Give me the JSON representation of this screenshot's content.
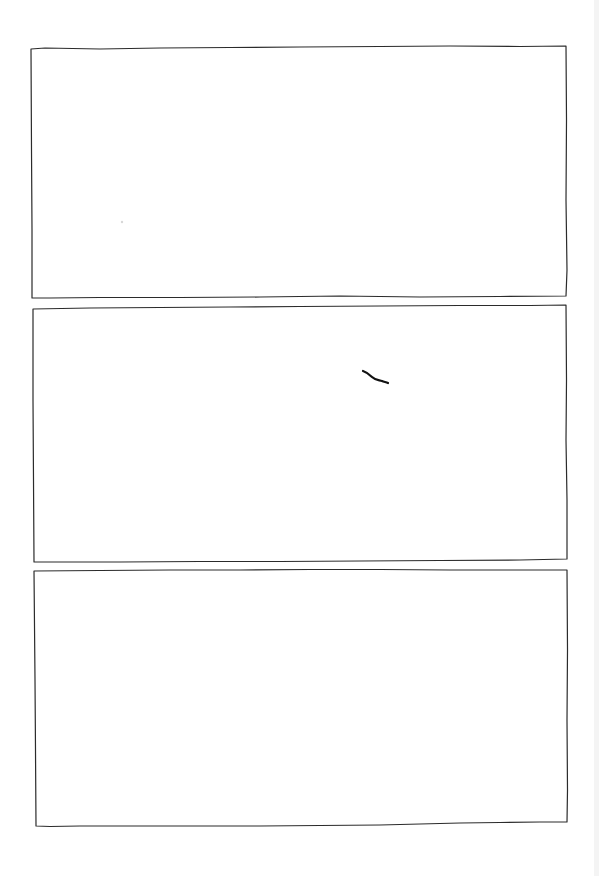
{
  "page": {
    "kind": "hand-drawn comic page",
    "background_color": "#ffffff",
    "ink_color": "#2b2b2b",
    "panel_count": 3
  },
  "panels": [
    {
      "label": "Panel 1",
      "content": "empty"
    },
    {
      "label": "Panel 2",
      "content": "single short ink stroke"
    },
    {
      "label": "Panel 3",
      "content": "empty"
    }
  ]
}
